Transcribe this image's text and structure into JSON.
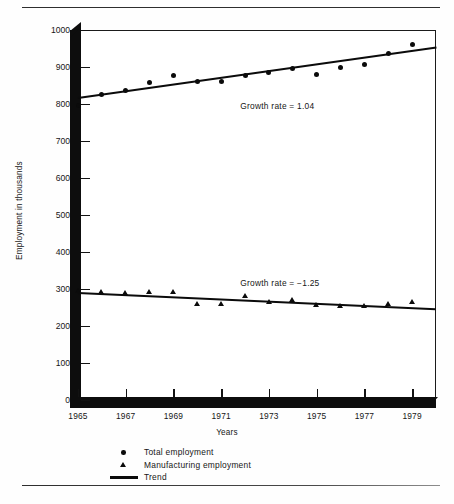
{
  "figure": {
    "y_axis_title": "Employment in thousands",
    "x_axis_title": "Years",
    "y_ticks": [
      "0",
      "100",
      "200",
      "300",
      "400",
      "500",
      "600",
      "700",
      "800",
      "900",
      "1000"
    ],
    "x_ticks": [
      "1965",
      "1967",
      "1969",
      "1971",
      "1973",
      "1975",
      "1977",
      "1979"
    ],
    "annotation_total": "Growth rate  =  1.04",
    "annotation_manufacturing": "Growth rate  =  −1.25"
  },
  "legend": {
    "items": [
      {
        "label": "Total employment",
        "marker": "circle-marker-icon"
      },
      {
        "label": "Manufacturing employment",
        "marker": "triangle-marker-icon"
      },
      {
        "label": "Trend",
        "marker": "line-marker-icon"
      }
    ]
  },
  "chart_data": {
    "type": "scatter",
    "title": "",
    "xlabel": "Years",
    "ylabel": "Employment in thousands",
    "xlim": [
      1965,
      1980
    ],
    "ylim": [
      0,
      1000
    ],
    "ytick_values": [
      0,
      100,
      200,
      300,
      400,
      500,
      600,
      700,
      800,
      900,
      1000
    ],
    "xtick_values": [
      1965,
      1967,
      1969,
      1971,
      1973,
      1975,
      1977,
      1979
    ],
    "grid": false,
    "legend_position": "below-axes-left",
    "x": [
      1965,
      1966,
      1967,
      1968,
      1969,
      1970,
      1971,
      1972,
      1973,
      1974,
      1975,
      1976,
      1977,
      1978,
      1979
    ],
    "series": [
      {
        "name": "Total employment",
        "marker": "circle",
        "values": [
          796,
          825,
          836,
          858,
          878,
          861,
          861,
          876,
          884,
          895,
          881,
          899,
          906,
          937,
          962
        ]
      },
      {
        "name": "Manufacturing employment",
        "marker": "triangle",
        "values": [
          293,
          292,
          287,
          291,
          291,
          258,
          259,
          279,
          265,
          268,
          256,
          253,
          253,
          258,
          263
        ]
      }
    ],
    "trends": [
      {
        "name": "Trend (Total employment)",
        "growth_rate": 1.04,
        "annotation": "Growth rate  =  1.04",
        "x_start": 1965,
        "y_start": 815,
        "x_end": 1980,
        "y_end": 951
      },
      {
        "name": "Trend (Manufacturing employment)",
        "growth_rate": -1.25,
        "annotation": "Growth rate  =  −1.25",
        "x_start": 1965,
        "y_start": 289,
        "x_end": 1980,
        "y_end": 245
      }
    ]
  }
}
